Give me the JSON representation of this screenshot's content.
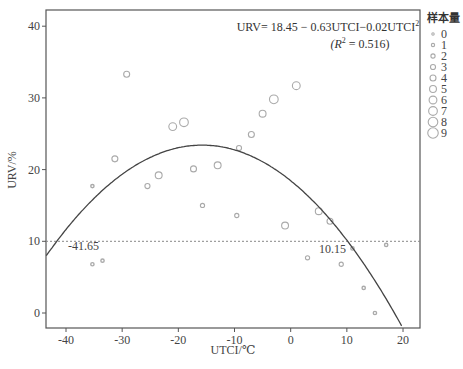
{
  "chart_data": {
    "type": "scatter",
    "title": "",
    "xlabel": "UTCI/℃",
    "ylabel": "URV/%",
    "xlim": [
      -43.5,
      23.0
    ],
    "ylim": [
      -2.1,
      42.2
    ],
    "x_ticks": [
      -40,
      -30,
      -20,
      -10,
      0,
      10,
      20
    ],
    "y_ticks": [
      0,
      10,
      20,
      30,
      40
    ],
    "grid": false,
    "legend_position": "right-outside",
    "legend": {
      "title": "样本量",
      "entries": [
        "0",
        "1",
        "2",
        "3",
        "4",
        "5",
        "6",
        "7",
        "8",
        "9"
      ]
    },
    "equation": {
      "line1": "URV= 18.45 − 0.63UTCI−0.02UTCI",
      "line1_sup": "2",
      "line2_pre": "(R",
      "line2_sup": "2",
      "line2_post": " = 0.516)"
    },
    "fit_curve": {
      "type": "quadratic",
      "intercept": 18.45,
      "b1": -0.63,
      "b2": -0.02,
      "label": "URV = 18.45 − 0.63UTCI − 0.02UTCI²",
      "r_squared": 0.516
    },
    "reference_line": {
      "y": 10,
      "style": "dotted"
    },
    "annotations": [
      {
        "text": "-41.65",
        "x": -41.65,
        "y": 10
      },
      {
        "text": "10.15",
        "x": 10.15,
        "y": 10
      }
    ],
    "series": [
      {
        "name": "samples",
        "points": [
          {
            "x": -29.2,
            "y": 33.3,
            "size": 4
          },
          {
            "x": -35.3,
            "y": 17.7,
            "size": 1
          },
          {
            "x": -31.3,
            "y": 21.5,
            "size": 4
          },
          {
            "x": -25.5,
            "y": 17.7,
            "size": 3
          },
          {
            "x": -23.5,
            "y": 19.2,
            "size": 5
          },
          {
            "x": -21.0,
            "y": 26.0,
            "size": 6
          },
          {
            "x": -19.0,
            "y": 26.6,
            "size": 7
          },
          {
            "x": -17.3,
            "y": 20.1,
            "size": 4
          },
          {
            "x": -13.0,
            "y": 20.6,
            "size": 5
          },
          {
            "x": -15.7,
            "y": 15.0,
            "size": 2
          },
          {
            "x": -9.6,
            "y": 13.6,
            "size": 2
          },
          {
            "x": -9.2,
            "y": 23.0,
            "size": 3
          },
          {
            "x": -7.0,
            "y": 24.9,
            "size": 4
          },
          {
            "x": -5.0,
            "y": 27.8,
            "size": 5
          },
          {
            "x": -3.0,
            "y": 29.8,
            "size": 7
          },
          {
            "x": 1.0,
            "y": 31.7,
            "size": 6
          },
          {
            "x": -1.0,
            "y": 12.2,
            "size": 5
          },
          {
            "x": 3.0,
            "y": 7.7,
            "size": 2
          },
          {
            "x": 5.0,
            "y": 14.2,
            "size": 5
          },
          {
            "x": 7.0,
            "y": 12.8,
            "size": 4
          },
          {
            "x": 9.0,
            "y": 6.8,
            "size": 2
          },
          {
            "x": 11.0,
            "y": 9.0,
            "size": 1
          },
          {
            "x": 13.0,
            "y": 3.5,
            "size": 1
          },
          {
            "x": 15.0,
            "y": 0.0,
            "size": 1
          },
          {
            "x": 17.0,
            "y": 9.5,
            "size": 1
          },
          {
            "x": -35.3,
            "y": 6.8,
            "size": 1
          },
          {
            "x": -33.5,
            "y": 7.3,
            "size": 1
          }
        ]
      }
    ],
    "colors": {
      "axis": "#555555",
      "curve": "#444444",
      "marker": "#aaaaaa",
      "reference": "#888888"
    }
  }
}
